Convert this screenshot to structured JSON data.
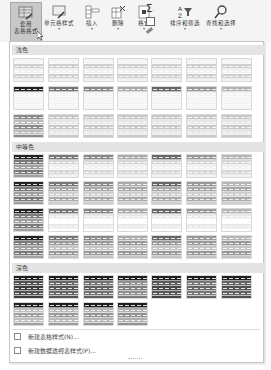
{
  "ribbon": {
    "buttons": [
      {
        "label_line1": "套用",
        "label_line2": "表格格式",
        "icon": "table-format-icon",
        "active": true
      },
      {
        "label_line1": "单元格样式",
        "label_line2": "",
        "icon": "cell-style-icon"
      },
      {
        "label_line1": "插入",
        "label_line2": "",
        "icon": "insert-icon"
      },
      {
        "label_line1": "删除",
        "label_line2": "",
        "icon": "delete-icon"
      },
      {
        "label_line1": "格式",
        "label_line2": "",
        "icon": "format-icon"
      },
      {
        "label_line1": "Σ",
        "label_line2": "",
        "icon": "autosum-icon"
      },
      {
        "label_line1": "排序和筛选",
        "label_line2": "",
        "icon": "sort-filter-icon"
      },
      {
        "label_line1": "查找和选择",
        "label_line2": "",
        "icon": "find-select-icon"
      }
    ],
    "dropdown_glyph": "▾"
  },
  "gallery": {
    "sections": [
      {
        "title": "浅色",
        "rows": 3,
        "cols": 7
      },
      {
        "title": "中等色",
        "rows": 4,
        "cols": 7
      },
      {
        "title": "深色",
        "rows": 2,
        "cols_last": 4
      }
    ]
  },
  "menu": {
    "items": [
      {
        "label": "新建表格样式(N)...",
        "icon": "new-table-style-icon"
      },
      {
        "label": "新建数据透视表样式(P)...",
        "icon": "new-pivot-style-icon"
      }
    ]
  },
  "colors": {
    "ribbon_bg": "#f4f4f4",
    "active_button": "#c8c8c8",
    "section_header_bg": "#e4e4e4",
    "panel_border": "#c6c6c6"
  }
}
